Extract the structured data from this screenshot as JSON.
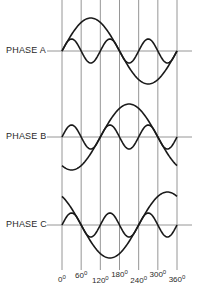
{
  "diagram": {
    "type": "three-phase waveforms with third harmonic",
    "phases": [
      {
        "label": "PHASE A",
        "fundamental_shift_deg": 0,
        "harmonic_order": 3,
        "harmonic_shift_deg": 0
      },
      {
        "label": "PHASE B",
        "fundamental_shift_deg": 120,
        "harmonic_order": 3,
        "harmonic_shift_deg": 0
      },
      {
        "label": "PHASE C",
        "fundamental_shift_deg": 240,
        "harmonic_order": 3,
        "harmonic_shift_deg": 0
      }
    ],
    "angle_axis": {
      "ticks_deg": [
        0,
        60,
        120,
        180,
        240,
        300,
        360
      ],
      "tick_labels": [
        "0",
        "60",
        "120",
        "180",
        "240",
        "300",
        "360"
      ],
      "degree_symbol": "0"
    },
    "colors": {
      "line": "#1a1a1a",
      "grid": "#8a8a8a",
      "background": "#ffffff"
    }
  },
  "layout": {
    "x0": 62,
    "x360": 177,
    "axis_x_start": 47,
    "axis_x_end": 192,
    "grid_top": 0,
    "grid_bottom": 270,
    "phase_axis_y": [
      51,
      137,
      225
    ],
    "fundamental_amplitude": 33,
    "harmonic_amplitude": 12,
    "phase_label_pos": [
      [
        6,
        45
      ],
      [
        6,
        131
      ],
      [
        6,
        219
      ]
    ],
    "tick_label_y": [
      281,
      277,
      282,
      276,
      282,
      276,
      281
    ]
  }
}
